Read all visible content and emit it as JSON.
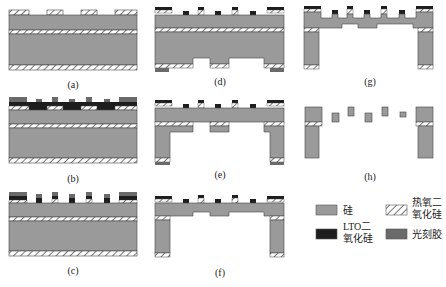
{
  "panels": [
    {
      "id": "a",
      "label": "(a)"
    },
    {
      "id": "b",
      "label": "(b)"
    },
    {
      "id": "c",
      "label": "(c)"
    },
    {
      "id": "d",
      "label": "(d)"
    },
    {
      "id": "e",
      "label": "(e)"
    },
    {
      "id": "f",
      "label": "(f)"
    },
    {
      "id": "g",
      "label": "(g)"
    },
    {
      "id": "h",
      "label": "(h)"
    }
  ],
  "legend": {
    "silicon": {
      "line1": "硅",
      "color": "#9a9a9a"
    },
    "thermal_oxide": {
      "line1": "热氧二",
      "line2": "氧化硅",
      "pattern": "hatched"
    },
    "lto_oxide": {
      "line1": "LTO二",
      "line2": "氧化硅",
      "color": "#1e1e1e"
    },
    "photoresist": {
      "line1": "光刻胶",
      "color": "#6a6a6a"
    }
  },
  "colors": {
    "silicon": "#9a9a9a",
    "lto": "#1e1e1e",
    "photoresist": "#6a6a6a",
    "outline": "#333333"
  }
}
